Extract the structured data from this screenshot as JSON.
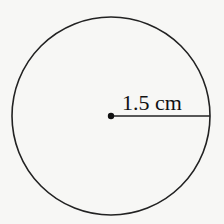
{
  "diagram": {
    "shape": "circle",
    "radius_label": "1.5 cm",
    "stroke_color": "#222222",
    "background_color": "#f7f7f5"
  }
}
